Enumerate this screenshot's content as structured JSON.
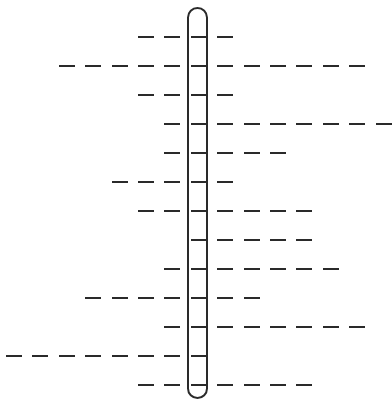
{
  "puzzle": {
    "type": "word-ladder-grid",
    "highlight_column_index": 7,
    "column_count": 15,
    "row_count": 13,
    "rows": [
      {
        "row": 1,
        "start_col": 5,
        "end_col": 8,
        "letters": 4
      },
      {
        "row": 2,
        "start_col": 2,
        "end_col": 13,
        "letters": 12
      },
      {
        "row": 3,
        "start_col": 5,
        "end_col": 8,
        "letters": 4
      },
      {
        "row": 4,
        "start_col": 6,
        "end_col": 14,
        "letters": 9
      },
      {
        "row": 5,
        "start_col": 6,
        "end_col": 10,
        "letters": 5
      },
      {
        "row": 6,
        "start_col": 4,
        "end_col": 8,
        "letters": 5
      },
      {
        "row": 7,
        "start_col": 5,
        "end_col": 11,
        "letters": 7
      },
      {
        "row": 8,
        "start_col": 7,
        "end_col": 11,
        "letters": 5
      },
      {
        "row": 9,
        "start_col": 6,
        "end_col": 12,
        "letters": 7
      },
      {
        "row": 10,
        "start_col": 3,
        "end_col": 9,
        "letters": 7
      },
      {
        "row": 11,
        "start_col": 6,
        "end_col": 13,
        "letters": 8
      },
      {
        "row": 12,
        "start_col": 0,
        "end_col": 7,
        "letters": 8
      },
      {
        "row": 13,
        "start_col": 5,
        "end_col": 11,
        "letters": 7
      }
    ],
    "colors": {
      "line": "#2a2a2a",
      "background": "#ffffff"
    }
  }
}
